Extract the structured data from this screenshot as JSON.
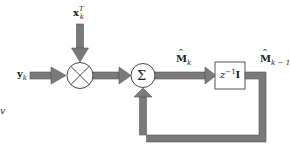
{
  "diagram": {
    "inputs": {
      "y": {
        "symbol": "y",
        "subscript": "k"
      },
      "x": {
        "symbol": "x",
        "subscript": "k",
        "superscript": "T"
      }
    },
    "nodes": {
      "multiplier": {
        "glyph": "⊗"
      },
      "summer": {
        "glyph": "Σ"
      },
      "delay": {
        "symbol": "z",
        "exponent": "−1",
        "matrix": "I"
      }
    },
    "signals": {
      "m_hat_k": {
        "hat": "^",
        "symbol": "M",
        "subscript": "k"
      },
      "m_hat_k_minus_1": {
        "hat": "^",
        "symbol": "M",
        "subscript": "k − 1"
      }
    },
    "stray_text": "v",
    "colors": {
      "arrow_fill": "#7a7a7a",
      "arrow_stroke": "#555555",
      "node_stroke": "#444444",
      "background": "#ffffff"
    }
  }
}
